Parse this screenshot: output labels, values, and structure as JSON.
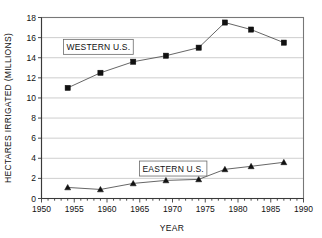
{
  "chart_data": {
    "type": "line",
    "title": "",
    "xlabel": "YEAR",
    "ylabel": "HECTARES IRRIGATED (MILLIONS)",
    "xlim": [
      1950,
      1990
    ],
    "ylim": [
      0,
      18
    ],
    "xticks": [
      1950,
      1955,
      1960,
      1965,
      1970,
      1975,
      1980,
      1985,
      1990
    ],
    "xtick_labels": [
      "1950",
      "1955",
      "1960",
      "1965",
      "1970",
      "1975",
      "1980",
      "1985",
      "1990"
    ],
    "yticks": [
      0,
      2,
      4,
      6,
      8,
      10,
      12,
      14,
      16,
      18
    ],
    "ytick_labels": [
      "0",
      "2",
      "4",
      "6",
      "8",
      "10",
      "12",
      "14",
      "16",
      "18"
    ],
    "grid": "horizontal",
    "legend_position": "inline-annotation",
    "series": [
      {
        "name": "WESTERN U.S.",
        "marker": "square",
        "x": [
          1954,
          1959,
          1964,
          1969,
          1974,
          1978,
          1982,
          1987
        ],
        "values": [
          11.0,
          12.5,
          13.6,
          14.2,
          15.0,
          17.5,
          16.8,
          15.5
        ]
      },
      {
        "name": "EASTERN U.S.",
        "marker": "triangle",
        "x": [
          1954,
          1959,
          1964,
          1969,
          1974,
          1978,
          1982,
          1987
        ],
        "values": [
          1.1,
          0.9,
          1.5,
          1.8,
          1.9,
          2.9,
          3.2,
          3.6
        ]
      }
    ],
    "annotations": [
      {
        "text": "WESTERN U.S.",
        "x": 1953.2,
        "y": 15.1,
        "boxed": true
      },
      {
        "text": "EASTERN U.S.",
        "x": 1964.8,
        "y": 3.0,
        "boxed": true
      }
    ],
    "colors": {
      "series_line": "#555555",
      "marker": "#111111",
      "gridline": "#b9b9b9",
      "frame": "#777777",
      "background": "#ffffff"
    }
  }
}
